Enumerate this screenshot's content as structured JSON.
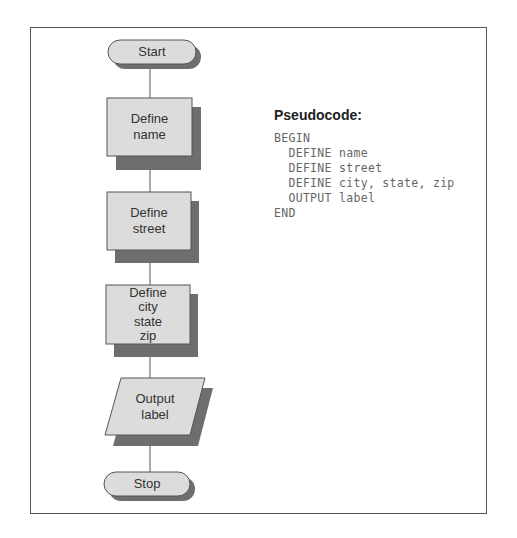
{
  "flowchart": {
    "nodes": [
      {
        "id": "start",
        "shape": "terminator",
        "label": "Start"
      },
      {
        "id": "define-name",
        "shape": "process",
        "label": "Define\nname"
      },
      {
        "id": "define-street",
        "shape": "process",
        "label": "Define\nstreet"
      },
      {
        "id": "define-city",
        "shape": "process",
        "label": "Define\ncity\nstate\nzip"
      },
      {
        "id": "output-label",
        "shape": "input-output",
        "label": "Output\nlabel"
      },
      {
        "id": "stop",
        "shape": "terminator",
        "label": "Stop"
      }
    ],
    "colors": {
      "fill": "#dcdcdc",
      "shadow": "#6e6e6e",
      "stroke": "#555555",
      "connector": "#555555"
    }
  },
  "pseudocode": {
    "title": "Pseudocode:",
    "lines": [
      "BEGIN",
      "  DEFINE name",
      "  DEFINE street",
      "  DEFINE city, state, zip",
      "  OUTPUT label",
      "END"
    ]
  }
}
